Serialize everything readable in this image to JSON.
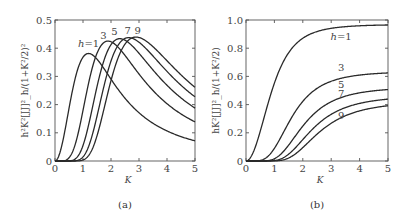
{
  "chart_data": [
    {
      "panel": "(a)",
      "type": "line",
      "title": "",
      "xlabel": "K",
      "ylabel": "h²K²[JJ]²_h/(1+K²/2)²",
      "xlim": [
        0,
        5
      ],
      "ylim": [
        0,
        0.5
      ],
      "xticks": [
        "0",
        "1",
        "2",
        "3",
        "4",
        "5"
      ],
      "yticks": [
        "0",
        "0.1",
        "0.2",
        "0.3",
        "0.4",
        "0.5"
      ],
      "grid": false,
      "series": [
        {
          "name": "h=1",
          "label": "h=1",
          "peak": {
            "x": 1.2,
            "y": 0.38
          },
          "end_value": 0.07
        },
        {
          "name": "h=3",
          "label": "3",
          "peak": {
            "x": 1.9,
            "y": 0.425
          },
          "end_value": 0.14
        },
        {
          "name": "h=5",
          "label": "5",
          "peak": {
            "x": 2.3,
            "y": 0.435
          },
          "end_value": 0.19
        },
        {
          "name": "h=7",
          "label": "7",
          "peak": {
            "x": 2.6,
            "y": 0.44
          },
          "end_value": 0.225
        },
        {
          "name": "h=9",
          "label": "9",
          "peak": {
            "x": 2.85,
            "y": 0.44
          },
          "end_value": 0.26
        }
      ]
    },
    {
      "panel": "(b)",
      "type": "line",
      "title": "",
      "xlabel": "K",
      "ylabel": "hK²[JJ]²_h/(1+K²/2)",
      "xlim": [
        0,
        5
      ],
      "ylim": [
        0,
        1.0
      ],
      "xticks": [
        "0",
        "1",
        "2",
        "3",
        "4",
        "5"
      ],
      "yticks": [
        "0",
        "0.2",
        "0.4",
        "0.6",
        "0.8",
        "1.0"
      ],
      "grid": false,
      "series": [
        {
          "name": "h=1",
          "label": "h=1",
          "end_value": 0.96
        },
        {
          "name": "h=3",
          "label": "3",
          "end_value": 0.62
        },
        {
          "name": "h=5",
          "label": "5",
          "end_value": 0.5
        },
        {
          "name": "h=7",
          "label": "7",
          "end_value": 0.44
        },
        {
          "name": "h=9",
          "label": "9",
          "end_value": 0.39
        }
      ]
    }
  ],
  "captions": {
    "a": "(a)",
    "b": "(b)"
  },
  "xlabel": "K",
  "ylabel_a": "h²K²[JJ]²_h/(1+K²/2)²",
  "ylabel_b": "hK²[JJ]²_h/(1+K²/2)",
  "harmonics": [
    1,
    3,
    5,
    7,
    9
  ],
  "labels_a": [
    {
      "text": "h=1",
      "x": 1.2,
      "y": 0.405
    },
    {
      "text": "3",
      "x": 1.73,
      "y": 0.432
    },
    {
      "text": "5",
      "x": 2.12,
      "y": 0.447
    },
    {
      "text": "7",
      "x": 2.6,
      "y": 0.452
    },
    {
      "text": "9",
      "x": 2.95,
      "y": 0.452
    }
  ],
  "labels_b": [
    {
      "text": "h=1",
      "x": 3.35,
      "y": 0.86
    },
    {
      "text": "3",
      "x": 3.35,
      "y": 0.635
    },
    {
      "text": "5",
      "x": 3.35,
      "y": 0.515
    },
    {
      "text": "7",
      "x": 3.35,
      "y": 0.455
    },
    {
      "text": "9",
      "x": 3.35,
      "y": 0.3
    }
  ]
}
